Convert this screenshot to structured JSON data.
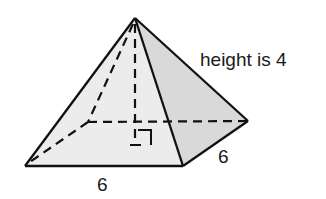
{
  "figure": {
    "type": "square-pyramid",
    "labels": {
      "height": "height is 4",
      "base_front_edge": "6",
      "base_side_edge": "6"
    },
    "colors": {
      "stroke": "#111111",
      "front_face": "#ececec",
      "right_face": "#d9d9d9",
      "background": "#ffffff"
    },
    "vertices": {
      "apex": [
        135,
        18
      ],
      "front_left": [
        25,
        166
      ],
      "front_right": [
        183,
        166
      ],
      "back_right": [
        248,
        121
      ],
      "back_left": [
        88,
        122
      ],
      "height_foot": [
        135,
        122
      ]
    },
    "annotations": {
      "right_angle_marker": "at foot of height",
      "hidden_edges_dashed": true
    }
  }
}
